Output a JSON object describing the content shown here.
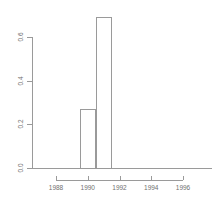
{
  "chart_data": {
    "type": "bar",
    "title": "",
    "subtitle": "",
    "xlabel": "",
    "ylabel": "",
    "grid": false,
    "legend": false,
    "xlim": [
      1987.0,
      1997.0
    ],
    "ylim": [
      0.0,
      0.6
    ],
    "x_ticks": [
      {
        "value": 1988,
        "label": "1988"
      },
      {
        "value": 1990,
        "label": "1990"
      },
      {
        "value": 1992,
        "label": "1992"
      },
      {
        "value": 1994,
        "label": "1994"
      },
      {
        "value": 1996,
        "label": "1996"
      }
    ],
    "y_ticks": [
      {
        "value": 0.0,
        "label": "0.0"
      },
      {
        "value": 0.2,
        "label": "0.2"
      },
      {
        "value": 0.4,
        "label": "0.4"
      },
      {
        "value": 0.6,
        "label": "0.6"
      }
    ],
    "bins": [
      {
        "x0": 1989.5,
        "x1": 1990.5,
        "value": 0.27
      },
      {
        "x0": 1990.5,
        "x1": 1991.5,
        "value": 0.69
      }
    ],
    "categories": [
      "1989.5-1990.5",
      "1990.5-1991.5"
    ],
    "values": [
      0.27,
      0.69
    ],
    "colors": {
      "axis": "#9a9a9a",
      "bar_stroke": "#9a9a9a",
      "bar_fill": "transparent",
      "tick_text": "#707070",
      "background": "#ffffff"
    }
  }
}
